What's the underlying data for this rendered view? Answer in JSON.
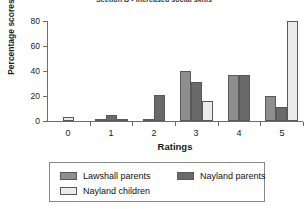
{
  "chart_data": {
    "type": "bar",
    "title": "Section B - Increased social skills",
    "xlabel": "Ratings",
    "ylabel": "Percentage scores",
    "categories": [
      "0",
      "1",
      "2",
      "3",
      "4",
      "5"
    ],
    "ylim": [
      0,
      80
    ],
    "yticks": [
      0,
      20,
      40,
      60,
      80
    ],
    "grid": false,
    "legend_position": "bottom",
    "series": [
      {
        "name": "Lawshall parents",
        "color": "#8e8e8e",
        "values": [
          0,
          2,
          2,
          40,
          37,
          20
        ]
      },
      {
        "name": "Nayland parents",
        "color": "#6a6a6a",
        "values": [
          0,
          5,
          21,
          31,
          37,
          11
        ]
      },
      {
        "name": "Nayland children",
        "color": "#ececec",
        "values": [
          3,
          2,
          0,
          16,
          0,
          80
        ]
      }
    ]
  },
  "axes": {
    "y_tick_labels": [
      "0",
      "20",
      "40",
      "60",
      "80"
    ],
    "x_tick_labels": [
      "0",
      "1",
      "2",
      "3",
      "4",
      "5"
    ]
  },
  "legend": {
    "items": [
      {
        "label": "Lawshall parents",
        "color": "#8e8e8e"
      },
      {
        "label": "Nayland parents",
        "color": "#6a6a6a"
      },
      {
        "label": "Nayland children",
        "color": "#ececec"
      }
    ]
  }
}
